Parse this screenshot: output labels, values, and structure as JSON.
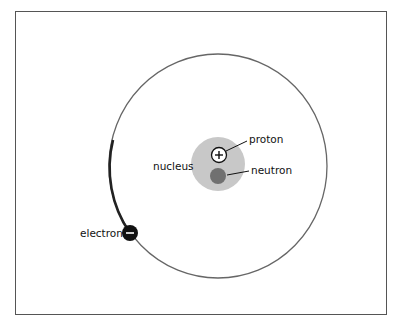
{
  "diagram": {
    "type": "atom-model",
    "labels": {
      "proton": "proton",
      "neutron": "neutron",
      "nucleus": "nucleus",
      "electron": "electron"
    },
    "symbols": {
      "proton": "+",
      "electron": "−"
    },
    "colors": {
      "orbit": "#555555",
      "nucleus": "#c8c8c8",
      "proton_fill": "#ffffff",
      "neutron_fill": "#707070",
      "electron_fill": "#111111",
      "frame": "#555555"
    }
  }
}
